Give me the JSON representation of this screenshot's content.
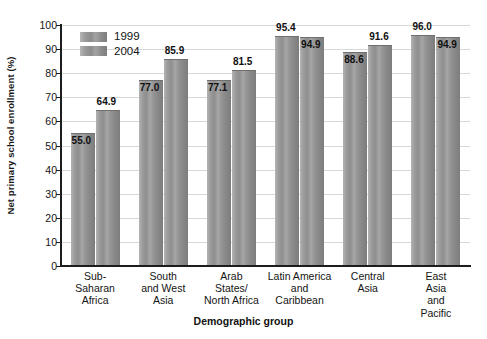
{
  "chart_data": {
    "type": "bar",
    "title": "",
    "xlabel": "Demographic group",
    "ylabel": "Net primary school enrollment (%)",
    "ylim": [
      0,
      100
    ],
    "ytick_step": 10,
    "yticks": [
      0,
      10,
      20,
      30,
      40,
      50,
      60,
      70,
      80,
      90,
      100
    ],
    "ytick_labels": [
      "0",
      "10",
      "20",
      "30",
      "40",
      "50",
      "60",
      "70",
      "80",
      "90",
      "100"
    ],
    "grid": true,
    "legend_position": "top-left",
    "categories": [
      "Sub-\nSaharan\nAfrica",
      "South\nand West\nAsia",
      "Arab\nStates/\nNorth Africa",
      "Latin America\nand\nCaribbean",
      "Central\nAsia",
      "East Asia\nand\nPacific"
    ],
    "category_labels": [
      [
        "Sub-",
        "Saharan",
        "Africa"
      ],
      [
        "South",
        "and West",
        "Asia"
      ],
      [
        "Arab",
        "States/",
        "North Africa"
      ],
      [
        "Latin America",
        "and",
        "Caribbean"
      ],
      [
        "Central",
        "Asia"
      ],
      [
        "East Asia",
        "and",
        "Pacific"
      ]
    ],
    "series": [
      {
        "name": "1999",
        "color": "#949494",
        "values": [
          55.0,
          77.0,
          77.1,
          95.4,
          88.6,
          96.0
        ],
        "value_labels": [
          "55.0",
          "77.0",
          "77.1",
          "95.4",
          "88.6",
          "96.0"
        ]
      },
      {
        "name": "2004",
        "color": "#949494",
        "values": [
          64.9,
          85.9,
          81.5,
          94.9,
          91.6,
          94.9
        ],
        "value_labels": [
          "64.9",
          "85.9",
          "81.5",
          "94.9",
          "91.6",
          "94.9"
        ]
      }
    ]
  },
  "legend": {
    "entries": [
      {
        "label": "1999"
      },
      {
        "label": "2004"
      }
    ]
  },
  "colors": {
    "bar_light": "#b4b4b4",
    "bar_dark": "#7d7d7d",
    "axis": "#1c1c1c",
    "gridline": "#d8d8d8",
    "text": "#141414",
    "background": "#ffffff"
  }
}
